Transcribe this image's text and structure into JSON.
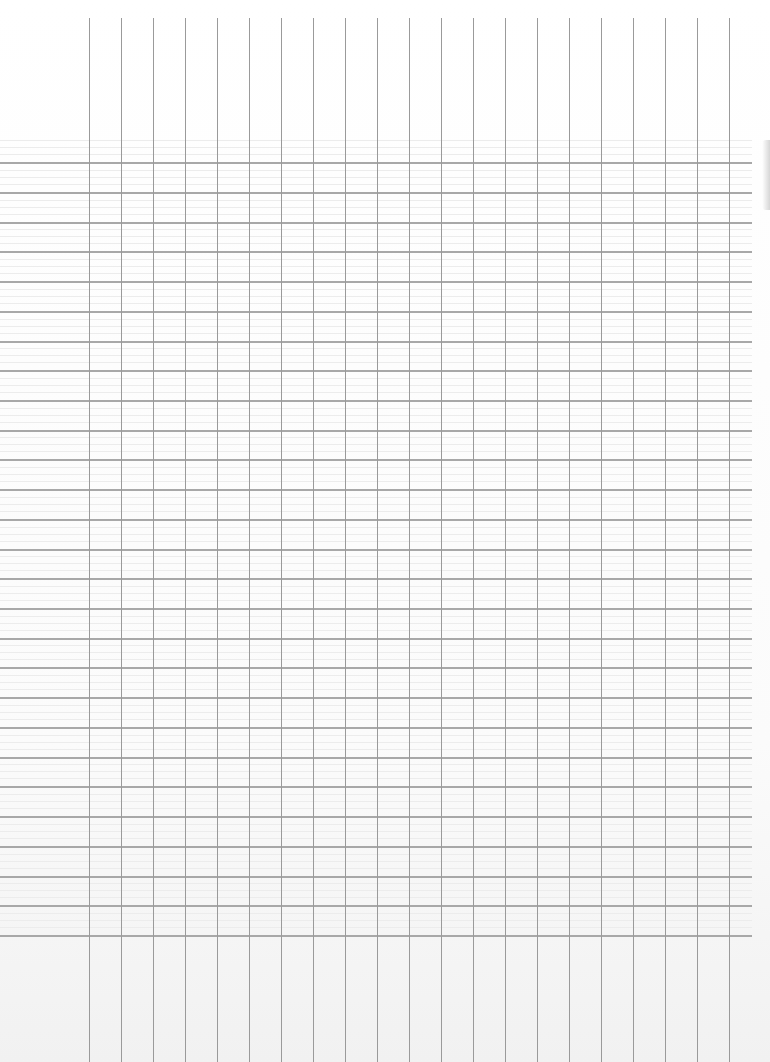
{
  "document": {
    "type": "blank ledger sheet",
    "grid": {
      "vertical_lines_x": [
        89,
        121,
        153,
        185,
        217,
        249,
        281,
        313,
        345,
        377,
        409,
        441,
        473,
        505,
        537,
        569,
        601,
        633,
        665,
        697,
        729
      ],
      "horizontal_lines_y": [
        162,
        192,
        222,
        251,
        281,
        311,
        341,
        370,
        400,
        430,
        459,
        489,
        519,
        549,
        578,
        608,
        638,
        667,
        697,
        727,
        757,
        786,
        816,
        846,
        876,
        905,
        935
      ],
      "line_color": "#a8a8a8",
      "vertical_line_color": "#9a9a9a",
      "background_color": "#ffffff"
    }
  }
}
